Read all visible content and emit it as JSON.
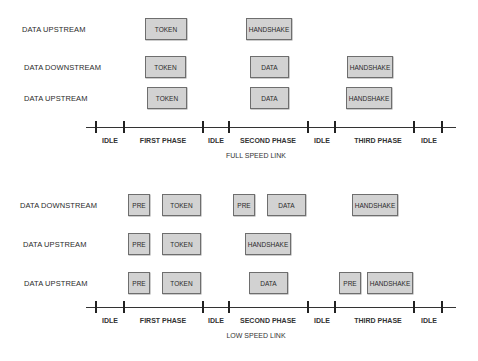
{
  "full_speed": {
    "caption": "FULL SPEED LINK",
    "rows": [
      {
        "label": "DATA UPSTREAM",
        "label_x": 22,
        "y": 18,
        "boxes": [
          {
            "text": "TOKEN",
            "x": 145,
            "w": 42
          },
          {
            "text": "HANDSHAKE",
            "x": 246,
            "w": 46
          }
        ]
      },
      {
        "label": "DATA DOWNSTREAM",
        "label_x": 24,
        "y": 56,
        "boxes": [
          {
            "text": "TOKEN",
            "x": 145,
            "w": 41
          },
          {
            "text": "DATA",
            "x": 250,
            "w": 39
          },
          {
            "text": "HANDSHAKE",
            "x": 347,
            "w": 46
          }
        ]
      },
      {
        "label": "DATA UPSTREAM",
        "label_x": 24,
        "y": 87,
        "boxes": [
          {
            "text": "TOKEN",
            "x": 147,
            "w": 40
          },
          {
            "text": "DATA",
            "x": 250,
            "w": 39
          },
          {
            "text": "HANDSHAKE",
            "x": 346,
            "w": 46
          }
        ]
      }
    ],
    "timeline": {
      "y": 127,
      "ticks": [
        96,
        124,
        203,
        229,
        308,
        335,
        414,
        442
      ],
      "phases": [
        {
          "text": "IDLE",
          "x": 110
        },
        {
          "text": "FIRST PHASE",
          "x": 163
        },
        {
          "text": "IDLE",
          "x": 216
        },
        {
          "text": "SECOND PHASE",
          "x": 268
        },
        {
          "text": "IDLE",
          "x": 322
        },
        {
          "text": "THIRD PHASE",
          "x": 378
        },
        {
          "text": "IDLE",
          "x": 429
        }
      ]
    }
  },
  "low_speed": {
    "caption": "LOW SPEED LINK",
    "rows": [
      {
        "label": "DATA DOWNSTREAM",
        "label_x": 20,
        "y": 194,
        "boxes": [
          {
            "text": "PRE",
            "x": 128,
            "w": 22
          },
          {
            "text": "TOKEN",
            "x": 162,
            "w": 39
          },
          {
            "text": "PRE",
            "x": 233,
            "w": 22
          },
          {
            "text": "DATA",
            "x": 267,
            "w": 39
          },
          {
            "text": "HANDSHAKE",
            "x": 352,
            "w": 46
          }
        ]
      },
      {
        "label": "DATA UPSTREAM",
        "label_x": 23,
        "y": 233,
        "boxes": [
          {
            "text": "PRE",
            "x": 128,
            "w": 22
          },
          {
            "text": "TOKEN",
            "x": 162,
            "w": 39
          },
          {
            "text": "HANDSHAKE",
            "x": 245,
            "w": 46
          }
        ]
      },
      {
        "label": "DATA UPSTREAM",
        "label_x": 24,
        "y": 272,
        "boxes": [
          {
            "text": "PRE",
            "x": 128,
            "w": 22
          },
          {
            "text": "TOKEN",
            "x": 162,
            "w": 39
          },
          {
            "text": "DATA",
            "x": 249,
            "w": 39
          },
          {
            "text": "PRE",
            "x": 339,
            "w": 22
          },
          {
            "text": "HANDSHAKE",
            "x": 367,
            "w": 46
          }
        ]
      }
    ],
    "timeline": {
      "y": 307,
      "ticks": [
        96,
        124,
        203,
        229,
        308,
        335,
        414,
        442
      ],
      "phases": [
        {
          "text": "IDLE",
          "x": 110
        },
        {
          "text": "FIRST PHASE",
          "x": 163
        },
        {
          "text": "IDLE",
          "x": 216
        },
        {
          "text": "SECOND PHASE",
          "x": 268
        },
        {
          "text": "IDLE",
          "x": 322
        },
        {
          "text": "THIRD PHASE",
          "x": 378
        },
        {
          "text": "IDLE",
          "x": 429
        }
      ]
    }
  },
  "colors": {
    "box_fill": "#d2d2d2",
    "box_border": "#6e6e6e",
    "line": "#333333"
  }
}
